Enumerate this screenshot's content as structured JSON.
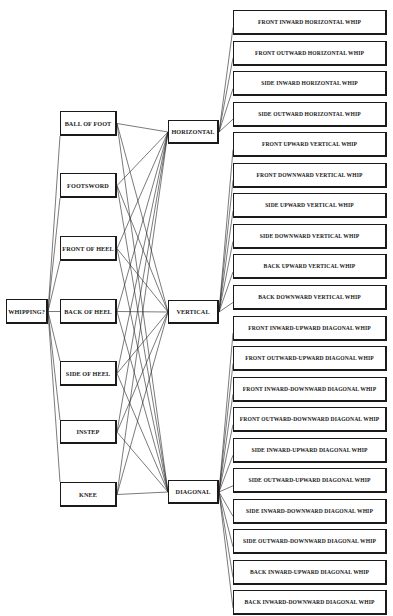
{
  "root": {
    "label": "WHIPPING?"
  },
  "contacts": [
    {
      "label": "BALL OF FOOT"
    },
    {
      "label": "FOOTSWORD"
    },
    {
      "label": "FRONT OF HEEL"
    },
    {
      "label": "BACK OF HEEL"
    },
    {
      "label": "SIDE OF HEEL"
    },
    {
      "label": "INSTEP"
    },
    {
      "label": "KNEE"
    }
  ],
  "planes": [
    {
      "label": "HORIZONTAL"
    },
    {
      "label": "VERTICAL"
    },
    {
      "label": "DIAGONAL"
    }
  ],
  "whips": [
    {
      "label": "FRONT INWARD HORIZONTAL WHIP",
      "plane": 0
    },
    {
      "label": "FRONT OUTWARD HORIZONTAL WHIP",
      "plane": 0
    },
    {
      "label": "SIDE INWARD HORIZONTAL WHIP",
      "plane": 0
    },
    {
      "label": "SIDE OUTWARD HORIZONTAL WHIP",
      "plane": 0
    },
    {
      "label": "FRONT UPWARD VERTICAL WHIP",
      "plane": 1
    },
    {
      "label": "FRONT DOWNWARD VERTICAL WHIP",
      "plane": 1
    },
    {
      "label": "SIDE UPWARD VERTICAL WHIP",
      "plane": 1
    },
    {
      "label": "SIDE DOWNWARD VERTICAL WHIP",
      "plane": 1
    },
    {
      "label": "BACK UPWARD VERTICAL WHIP",
      "plane": 1
    },
    {
      "label": "BACK DOWNWARD VERTICAL WHIP",
      "plane": 1
    },
    {
      "label": "FRONT INWARD-UPWARD DIAGONAL WHIP",
      "plane": 2
    },
    {
      "label": "FRONT OUTWARD-UPWARD DIAGONAL WHIP",
      "plane": 2
    },
    {
      "label": "FRONT INWARD-DOWNWARD DIAGONAL WHIP",
      "plane": 2
    },
    {
      "label": "FRONT OUTWARD-DOWNWARD DIAGONAL WHIP",
      "plane": 2
    },
    {
      "label": "SIDE INWARD-UPWARD DIAGONAL WHIP",
      "plane": 2
    },
    {
      "label": "SIDE OUTWARD-UPWARD DIAGONAL WHIP",
      "plane": 2
    },
    {
      "label": "SIDE INWARD-DOWNWARD DIAGONAL WHIP",
      "plane": 2
    },
    {
      "label": "SIDE OUTWARD-DOWNWARD DIAGONAL WHIP",
      "plane": 2
    },
    {
      "label": "BACK INWARD-UPWARD DIAGONAL WHIP",
      "plane": 2
    },
    {
      "label": "BACK INWARD-DOWNWARD DIAGONAL WHIP",
      "plane": 2
    }
  ],
  "colors": {
    "stroke": "#1a1a1a",
    "background": "#ffffff"
  }
}
